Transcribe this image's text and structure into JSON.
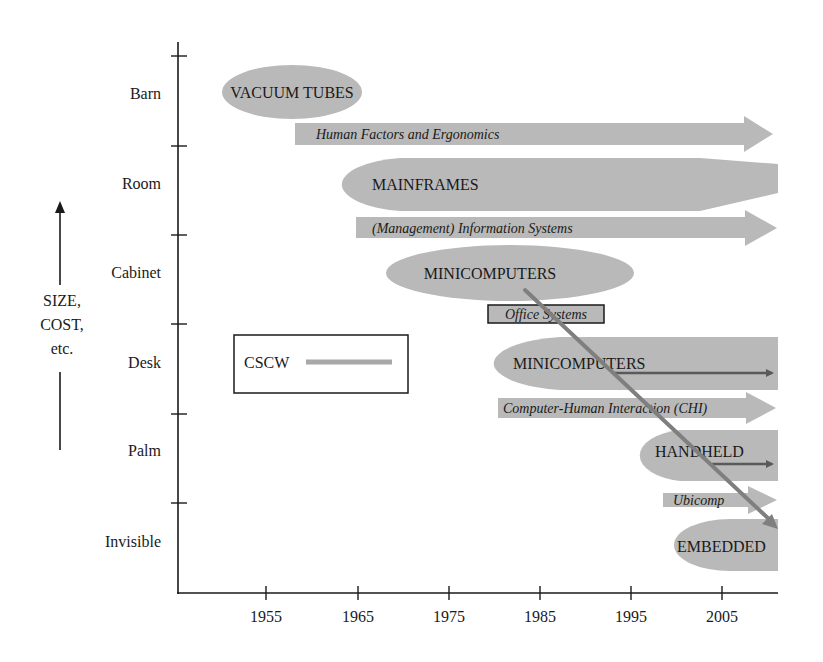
{
  "figure": {
    "y_axis": {
      "title_lines": [
        "SIZE,",
        "COST,",
        "etc."
      ],
      "categories": [
        "Barn",
        "Room",
        "Cabinet",
        "Desk",
        "Palm",
        "Invisible"
      ]
    },
    "x_axis": {
      "ticks": [
        "1955",
        "1965",
        "1975",
        "1985",
        "1995",
        "2005"
      ]
    },
    "platforms": [
      {
        "id": "vacuum-tubes",
        "label": "VACUUM TUBES",
        "row": "Barn",
        "start": 1950,
        "end": 1965,
        "open_ended": false
      },
      {
        "id": "mainframes",
        "label": "MAINFRAMES",
        "row": "Room",
        "start": 1962,
        "end": 2010,
        "open_ended": true
      },
      {
        "id": "minicomputers-cabinet",
        "label": "MINICOMPUTERS",
        "row": "Cabinet",
        "start": 1969,
        "end": 1982,
        "open_ended": false
      },
      {
        "id": "minicomputers-desk",
        "label": "MINICOMPUTERS",
        "row": "Desk",
        "start": 1978,
        "end": 2010,
        "open_ended": true
      },
      {
        "id": "handheld",
        "label": "HANDHELD",
        "row": "Palm",
        "start": 1997,
        "end": 2010,
        "open_ended": true
      },
      {
        "id": "embedded",
        "label": "EMBEDDED",
        "row": "Invisible",
        "start": 2001,
        "end": 2010,
        "open_ended": true
      }
    ],
    "fields": [
      {
        "id": "hfe",
        "label": "Human Factors and Ergonomics",
        "start": 1957,
        "end": 2010
      },
      {
        "id": "mis",
        "label": "(Management) Information Systems",
        "start": 1964,
        "end": 2010
      },
      {
        "id": "office-systems",
        "label": "Office Systems",
        "start": 1979,
        "end": 1992,
        "boxed": true
      },
      {
        "id": "chi",
        "label": "Computer-Human Interaction (CHI)",
        "start": 1980,
        "end": 2010
      },
      {
        "id": "ubicomp",
        "label": "Ubicomp",
        "start": 1998,
        "end": 2010
      }
    ],
    "legend": {
      "label": "CSCW"
    },
    "colors": {
      "shape_fill": "#b9b9b9",
      "cscw_line": "#7f7f7f",
      "axis": "#1a1a1a"
    }
  }
}
